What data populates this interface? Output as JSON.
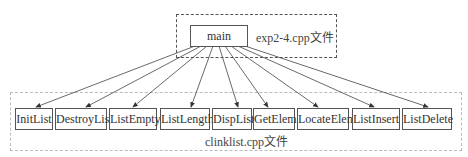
{
  "top_group": {
    "label": "exp2-4.cpp文件"
  },
  "main_node": {
    "label": "main"
  },
  "bottom_group": {
    "label": "clinklist.cpp文件"
  },
  "functions": [
    {
      "label": "InitList",
      "x": 15,
      "w": 38
    },
    {
      "label": "DestroyList",
      "x": 55,
      "w": 52
    },
    {
      "label": "ListEmpty",
      "x": 109,
      "w": 48
    },
    {
      "label": "ListLength",
      "x": 160,
      "w": 50
    },
    {
      "label": "DispList",
      "x": 212,
      "w": 40
    },
    {
      "label": "GetElem",
      "x": 253,
      "w": 42
    },
    {
      "label": "LocateElem",
      "x": 297,
      "w": 52
    },
    {
      "label": "ListInsert",
      "x": 352,
      "w": 48
    },
    {
      "label": "ListDelete",
      "x": 402,
      "w": 50
    }
  ]
}
